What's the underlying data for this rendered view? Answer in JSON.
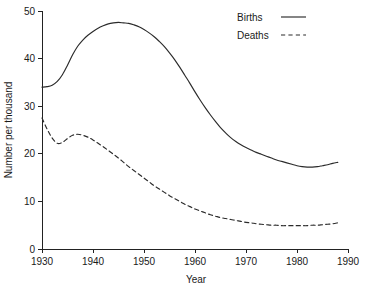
{
  "chart_data": {
    "type": "line",
    "title": "",
    "xlabel": "Year",
    "ylabel": "Number per thousand",
    "xlim": [
      1930,
      1990
    ],
    "ylim": [
      0,
      50
    ],
    "grid": false,
    "legend_position": "top-right",
    "x_ticks": [
      1930,
      1940,
      1950,
      1960,
      1970,
      1980,
      1990
    ],
    "x_tick_labels": [
      "1930",
      "1940",
      "1950",
      "1960",
      "1970",
      "1980",
      "1990"
    ],
    "y_ticks": [
      0,
      10,
      20,
      30,
      40,
      50
    ],
    "y_tick_labels": [
      "0",
      "10",
      "20",
      "30",
      "40",
      "50"
    ],
    "x": [
      1930,
      1931,
      1932,
      1933,
      1934,
      1935,
      1936,
      1937,
      1938,
      1939,
      1940,
      1941,
      1942,
      1943,
      1944,
      1945,
      1946,
      1947,
      1948,
      1949,
      1950,
      1951,
      1952,
      1953,
      1954,
      1955,
      1956,
      1957,
      1958,
      1959,
      1960,
      1961,
      1962,
      1963,
      1964,
      1965,
      1966,
      1967,
      1968,
      1969,
      1970,
      1971,
      1972,
      1973,
      1974,
      1975,
      1976,
      1977,
      1978,
      1979,
      1980,
      1981,
      1982,
      1983,
      1984,
      1985,
      1986,
      1987,
      1988
    ],
    "series": [
      {
        "name": "Births",
        "style": "solid",
        "color": "#2b2b2b",
        "values": [
          34.0,
          34.1,
          34.4,
          35.2,
          36.6,
          38.6,
          40.8,
          42.6,
          43.9,
          44.9,
          45.7,
          46.4,
          46.9,
          47.3,
          47.5,
          47.6,
          47.5,
          47.4,
          47.1,
          46.7,
          46.1,
          45.4,
          44.6,
          43.6,
          42.5,
          41.2,
          39.8,
          38.2,
          36.5,
          34.8,
          33.0,
          31.3,
          29.7,
          28.2,
          26.8,
          25.5,
          24.4,
          23.4,
          22.6,
          21.9,
          21.3,
          20.8,
          20.3,
          19.9,
          19.5,
          19.1,
          18.7,
          18.4,
          18.1,
          17.8,
          17.5,
          17.3,
          17.2,
          17.2,
          17.3,
          17.5,
          17.7,
          18.0,
          18.2
        ]
      },
      {
        "name": "Deaths",
        "style": "dashed",
        "color": "#2b2b2b",
        "values": [
          27.5,
          25.2,
          23.3,
          22.2,
          22.4,
          23.2,
          23.9,
          24.1,
          23.9,
          23.5,
          22.9,
          22.2,
          21.5,
          20.7,
          19.9,
          19.1,
          18.2,
          17.3,
          16.5,
          15.7,
          14.9,
          14.1,
          13.3,
          12.6,
          11.9,
          11.2,
          10.6,
          10.0,
          9.4,
          8.9,
          8.4,
          8.0,
          7.6,
          7.2,
          6.9,
          6.6,
          6.4,
          6.2,
          6.0,
          5.8,
          5.6,
          5.5,
          5.3,
          5.2,
          5.1,
          5.0,
          5.0,
          4.9,
          4.9,
          4.9,
          4.9,
          4.9,
          4.9,
          5.0,
          5.0,
          5.1,
          5.2,
          5.3,
          5.5
        ]
      }
    ],
    "legend": [
      {
        "label": "Births",
        "style": "solid"
      },
      {
        "label": "Deaths",
        "style": "dashed"
      }
    ]
  }
}
